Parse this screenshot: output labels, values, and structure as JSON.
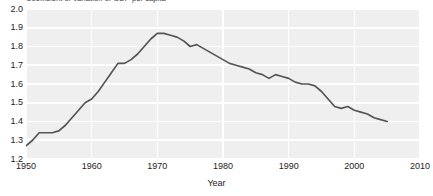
{
  "chart_data": {
    "type": "line",
    "title": "Coefficient of variation of GDP per capita",
    "xlabel": "Year",
    "ylabel": "",
    "xlim": [
      1950,
      2010
    ],
    "ylim": [
      1.2,
      2.0
    ],
    "xticks": [
      "1950",
      "1960",
      "1970",
      "1980",
      "1990",
      "2000",
      "2010"
    ],
    "yticks": [
      "2.0",
      "1.9",
      "1.8",
      "1.7",
      "1.6",
      "1.5",
      "1.4",
      "1.3",
      "1.2"
    ],
    "grid": true,
    "legend": "none",
    "series": [
      {
        "name": "Coefficient of variation of GDP per capita",
        "color": "#555555",
        "x": [
          1950,
          1951,
          1952,
          1953,
          1954,
          1955,
          1956,
          1957,
          1958,
          1959,
          1960,
          1961,
          1962,
          1963,
          1964,
          1965,
          1966,
          1967,
          1968,
          1969,
          1970,
          1971,
          1972,
          1973,
          1974,
          1975,
          1976,
          1977,
          1978,
          1979,
          1980,
          1981,
          1982,
          1983,
          1984,
          1985,
          1986,
          1987,
          1988,
          1989,
          1990,
          1991,
          1992,
          1993,
          1994,
          1995,
          1996,
          1997,
          1998,
          1999,
          2000,
          2001,
          2002,
          2003,
          2004,
          2005
        ],
        "values": [
          1.27,
          1.3,
          1.34,
          1.34,
          1.34,
          1.35,
          1.38,
          1.42,
          1.46,
          1.5,
          1.52,
          1.56,
          1.61,
          1.66,
          1.71,
          1.71,
          1.73,
          1.76,
          1.8,
          1.84,
          1.87,
          1.87,
          1.86,
          1.85,
          1.83,
          1.8,
          1.81,
          1.79,
          1.77,
          1.75,
          1.73,
          1.71,
          1.7,
          1.69,
          1.68,
          1.66,
          1.65,
          1.63,
          1.65,
          1.64,
          1.63,
          1.61,
          1.6,
          1.6,
          1.59,
          1.56,
          1.52,
          1.48,
          1.47,
          1.48,
          1.46,
          1.45,
          1.44,
          1.42,
          1.41,
          1.4
        ]
      }
    ]
  },
  "chart": {
    "title": "Coefficient of variation of GDP per capita",
    "xlabel": "Year",
    "accent_color": "#555555",
    "plot_background": "#efefef",
    "gridline_color": "#ffffff"
  }
}
